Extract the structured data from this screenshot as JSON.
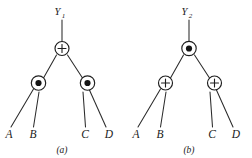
{
  "figure": {
    "title": "",
    "background_color": "#ffffff",
    "line_color": "#2b2b2b",
    "text_color": "#1a1a1a",
    "panels": [
      {
        "id": "a",
        "caption": "(a)",
        "root_output_label": "Y",
        "root_output_subscript": "1",
        "root_node": {
          "name": "root-node-a",
          "operator": "+",
          "symbol": "plus-in-circle"
        },
        "children": [
          {
            "name": "left-node-a",
            "operator": "⊙",
            "symbol": "dot-in-circle",
            "leaves": [
              "A",
              "B"
            ]
          },
          {
            "name": "right-node-a",
            "operator": "⊙",
            "symbol": "dot-in-circle",
            "leaves": [
              "C",
              "D"
            ]
          }
        ]
      },
      {
        "id": "b",
        "caption": "(b)",
        "root_output_label": "Y",
        "root_output_subscript": "2",
        "root_node": {
          "name": "root-node-b",
          "operator": "⊙",
          "symbol": "dot-in-circle"
        },
        "children": [
          {
            "name": "left-node-b",
            "operator": "+",
            "symbol": "plus-in-circle",
            "leaves": [
              "A",
              "B"
            ]
          },
          {
            "name": "right-node-b",
            "operator": "+",
            "symbol": "plus-in-circle",
            "leaves": [
              "C",
              "D"
            ]
          }
        ]
      }
    ]
  }
}
